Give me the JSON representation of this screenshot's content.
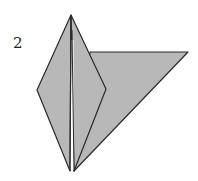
{
  "diagram": {
    "type": "origami-fold-step",
    "step_number": "2",
    "colors": {
      "paper_fill": "#b8b8b8",
      "line": "#2a2a2a",
      "background": "#ffffff"
    }
  }
}
